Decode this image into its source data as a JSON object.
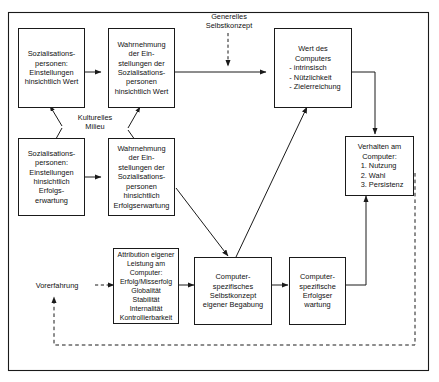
{
  "diagram": {
    "frame": {
      "name": "outer-frame"
    },
    "boxes": [
      {
        "id": "sozialisation-wert",
        "text": "Sozialisations-\npersonen:\nEinstellungen\nhinsichtlich Wert"
      },
      {
        "id": "wahrnehmung-wert",
        "text": "Wahrnehmung\nder Ein-\nstellungen der\nSozialisations-\npersonen\nhinsichtlich Wert"
      },
      {
        "id": "wert-des-computers",
        "text": "Wert des\nComputers",
        "list": "- intrinsisch\n- Nützlichkeit\n- Zielerreichung"
      },
      {
        "id": "sozialisation-erfolg",
        "text": "Sozialisations-\npersonen:\nEinstellungen\nhinsichtlich\nErfolgs-\nerwartung"
      },
      {
        "id": "wahrnehmung-erfolg",
        "text": "Wahrnehmung\nder Ein-\nstellungen der\nSozialisations-\npersonen\nhinsichtlich\nErfolgserwartung"
      },
      {
        "id": "verhalten-am-computer",
        "text": "Verhalten am\nComputer:",
        "list": "1. Nutzung\n2. Wahl\n3. Persistenz"
      },
      {
        "id": "attribution",
        "text": "Attribution eigener\nLeistung am\nComputer:\nErfolg/Misserfolg\nGlobalität\nStabilität\nInternalität\nKontrollierbarkeit"
      },
      {
        "id": "selbstkonzept-begabung",
        "text": "Computer-\nspezifisches\nSelbstkonzept\neigener Begabung"
      },
      {
        "id": "erfolgserwartung",
        "text": "Computer-\nspezifische\nErfolgser\nwartung"
      }
    ],
    "labels": [
      {
        "id": "generelles-selbstkonzept",
        "text": "Generelles\nSelbstkonzept"
      },
      {
        "id": "kulturelles-milieu",
        "text": "Kulturelles\nMilieu"
      },
      {
        "id": "vorerfahrung",
        "text": "Vorerfahrung"
      }
    ],
    "colors": {
      "stroke": "#1a1a1a",
      "background": "#ffffff",
      "text": "#111111"
    }
  }
}
